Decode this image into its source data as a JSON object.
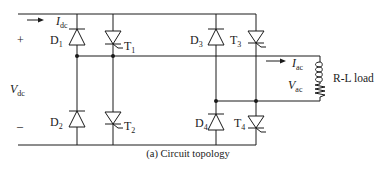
{
  "diagram": {
    "caption": "(a) Circuit topology",
    "dc_source": {
      "voltage_symbol": "V",
      "voltage_sub": "dc",
      "positive": "+",
      "negative": "–",
      "current_symbol": "I",
      "current_sub": "dc"
    },
    "ac_output": {
      "current_symbol": "I",
      "current_sub": "ac",
      "voltage_symbol": "V",
      "voltage_sub": "ac",
      "load_label": "R-L load"
    },
    "components": [
      {
        "id": "D1",
        "type": "diode",
        "label": "D",
        "sub": "1"
      },
      {
        "id": "T1",
        "type": "thyristor",
        "label": "T",
        "sub": "1"
      },
      {
        "id": "D2",
        "type": "diode",
        "label": "D",
        "sub": "2"
      },
      {
        "id": "T2",
        "type": "thyristor",
        "label": "T",
        "sub": "2"
      },
      {
        "id": "D3",
        "type": "diode",
        "label": "D",
        "sub": "3"
      },
      {
        "id": "T3",
        "type": "thyristor",
        "label": "T",
        "sub": "3"
      },
      {
        "id": "D4",
        "type": "diode",
        "label": "D",
        "sub": "4"
      },
      {
        "id": "T4",
        "type": "thyristor",
        "label": "T",
        "sub": "4"
      }
    ],
    "colors": {
      "stroke": "#1a1a1a",
      "background": "#ffffff"
    }
  }
}
